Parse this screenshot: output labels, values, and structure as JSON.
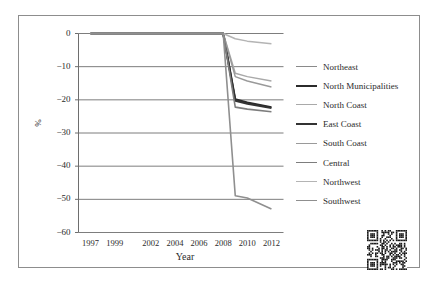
{
  "figure": {
    "qr_code_name": "qr-code",
    "frame_color": "#8d8d8d",
    "background": "#ffffff"
  },
  "chart_data": {
    "type": "line",
    "title": "",
    "xlabel": "Year",
    "ylabel": "%",
    "xlim": [
      1996,
      2013
    ],
    "ylim": [
      -60,
      0
    ],
    "ytick_labels": [
      "0",
      "−10",
      "−20",
      "−30",
      "−40",
      "−50",
      "−60"
    ],
    "ytick_values": [
      0,
      -10,
      -20,
      -30,
      -40,
      -50,
      -60
    ],
    "xtick_labels": [
      "1997",
      "1999",
      "2002",
      "2004",
      "2006",
      "2008",
      "2010",
      "2012"
    ],
    "xtick_values": [
      1997,
      1999,
      2002,
      2004,
      2006,
      2008,
      2010,
      2012
    ],
    "grid": true,
    "grid_axis": "y",
    "legend_position": "right",
    "x": [
      1997,
      1999,
      2002,
      2004,
      2006,
      2008,
      2009,
      2010,
      2012
    ],
    "series": [
      {
        "name": "Northeast",
        "color": "#8a8a8a",
        "width": 1.6,
        "values": [
          0,
          0,
          0,
          0,
          0,
          0,
          -20.0,
          -21.0,
          -22.3
        ]
      },
      {
        "name": "North Municipalities",
        "color": "#2b2b2b",
        "width": 2.0,
        "values": [
          0,
          0,
          0,
          0,
          0,
          0,
          -19.8,
          -20.8,
          -22.2
        ]
      },
      {
        "name": "North Coast",
        "color": "#a9a9a9",
        "width": 1.5,
        "values": [
          0,
          0,
          0,
          0,
          0,
          0,
          -12.0,
          -13.0,
          -14.3
        ]
      },
      {
        "name": "East Coast",
        "color": "#333333",
        "width": 2.0,
        "values": [
          0,
          0,
          0,
          0,
          0,
          0,
          -20.3,
          -21.2,
          -22.5
        ]
      },
      {
        "name": "South Coast",
        "color": "#9a9a9a",
        "width": 1.5,
        "values": [
          0,
          0,
          0,
          0,
          0,
          0,
          -13.0,
          -14.3,
          -16.1
        ]
      },
      {
        "name": "Central",
        "color": "#7d7d7d",
        "width": 1.6,
        "values": [
          0,
          0,
          0,
          0,
          0,
          0,
          -22.2,
          -22.8,
          -23.6
        ]
      },
      {
        "name": "Northwest",
        "color": "#b4b4b4",
        "width": 1.5,
        "values": [
          0,
          0,
          0,
          0,
          0,
          0,
          -1.6,
          -2.3,
          -3.1
        ]
      },
      {
        "name": "Southwest",
        "color": "#8f8f8f",
        "width": 1.6,
        "values": [
          0,
          0,
          0,
          0,
          0,
          0,
          -48.9,
          -49.6,
          -52.9
        ]
      }
    ]
  }
}
